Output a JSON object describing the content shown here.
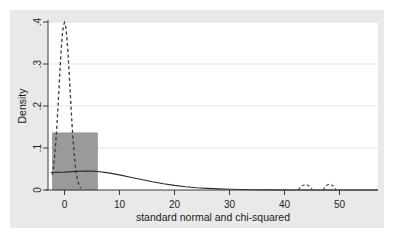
{
  "figure": {
    "panel_bg": "#e9e9e9",
    "plot_bg": "#ffffff",
    "outer_bg": "#ffffff"
  },
  "chart_data": {
    "type": "line",
    "title": "",
    "xlabel": "standard normal and chi-squared",
    "ylabel": "Density",
    "xlim": [
      -3,
      57
    ],
    "ylim": [
      0,
      0.4
    ],
    "xticks": [
      0,
      10,
      20,
      30,
      40,
      50
    ],
    "xtick_labels": [
      "0",
      "10",
      "20",
      "30",
      "40",
      "50"
    ],
    "yticks": [
      0,
      0.1,
      0.2,
      0.3,
      0.4
    ],
    "ytick_labels": [
      "0",
      ".1",
      ".2",
      ".3",
      ".4"
    ],
    "grid": "horizontal",
    "legend": "none",
    "series": [
      {
        "name": "histogram-bar",
        "type": "bar",
        "color": "#9a9a9a",
        "edge_color": "#8a8a8a",
        "bars": [
          {
            "x_start": -2.2,
            "x_end": 6.0,
            "height": 0.136
          }
        ]
      },
      {
        "name": "standard normal density",
        "type": "line",
        "style": "dashed",
        "color": "#3a3a3a",
        "x": [
          -2.2,
          -2.0,
          -1.8,
          -1.6,
          -1.4,
          -1.2,
          -1.0,
          -0.8,
          -0.6,
          -0.4,
          -0.2,
          0.0,
          0.2,
          0.4,
          0.6,
          0.8,
          1.0,
          1.2,
          1.4,
          1.6,
          1.8,
          2.0,
          2.2,
          2.4,
          2.6,
          2.8,
          3.0
        ],
        "y": [
          0.0355,
          0.054,
          0.079,
          0.1109,
          0.1497,
          0.1942,
          0.242,
          0.2897,
          0.3332,
          0.3683,
          0.391,
          0.3989,
          0.391,
          0.3683,
          0.3332,
          0.2897,
          0.242,
          0.1942,
          0.1497,
          0.1109,
          0.079,
          0.054,
          0.0355,
          0.0224,
          0.0136,
          0.0079,
          0.0044
        ]
      },
      {
        "name": "chi-squared density",
        "type": "line",
        "style": "solid",
        "color": "#2a2a2a",
        "x": [
          -2.5,
          0,
          2,
          4,
          5,
          6,
          8,
          10,
          12,
          14,
          16,
          18,
          20,
          22,
          24,
          26,
          28,
          30,
          34,
          38,
          42,
          46,
          50,
          54,
          57
        ],
        "y": [
          0.0415,
          0.0425,
          0.0443,
          0.0452,
          0.045,
          0.0441,
          0.0408,
          0.036,
          0.0305,
          0.0249,
          0.0196,
          0.0149,
          0.011,
          0.0079,
          0.0055,
          0.0038,
          0.0026,
          0.0017,
          0.0007,
          0.0003,
          0.0001,
          5e-05,
          2e-05,
          1e-05,
          1e-05
        ]
      },
      {
        "name": "small dashed bump left",
        "type": "arc",
        "style": "dashed",
        "color": "#4a4a4a",
        "center_x": 43.8,
        "width": 2.6,
        "height": 0.016
      },
      {
        "name": "small dashed bump right",
        "type": "arc",
        "style": "dashed",
        "color": "#4a4a4a",
        "center_x": 48.2,
        "width": 2.4,
        "height": 0.017
      }
    ]
  }
}
